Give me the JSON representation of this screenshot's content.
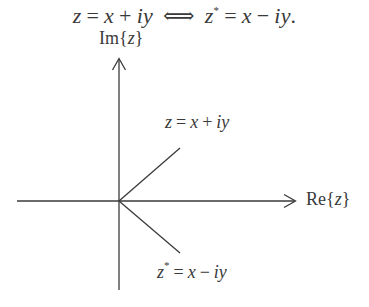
{
  "header": {
    "equation": {
      "lhs_var": "z",
      "eq1": "=",
      "x1": "x",
      "plus": "+",
      "iy1": "iy",
      "iff": "⟺",
      "rhs_var": "z",
      "rhs_star": "*",
      "eq2": "=",
      "x2": "x",
      "minus": "−",
      "iy2": "iy",
      "period": "."
    }
  },
  "axes": {
    "imaginary_label": {
      "prefix": "Im",
      "open": "{",
      "var": "z",
      "close": "}"
    },
    "real_label": {
      "prefix": "Re",
      "open": "{",
      "var": "z",
      "close": "}"
    }
  },
  "vectors": {
    "z": {
      "var": "z",
      "eq": "=",
      "x": "x",
      "op": "+",
      "iy": "iy"
    },
    "z_conjugate": {
      "var": "z",
      "star": "*",
      "eq": "=",
      "x": "x",
      "op": "−",
      "iy": "iy"
    }
  },
  "colors": {
    "ink": "#3a3a3a",
    "background": "#ffffff"
  },
  "geometry": {
    "origin": [
      119,
      201
    ],
    "z_tip": [
      180,
      148
    ],
    "z_conjugate_tip": [
      180,
      253
    ],
    "vertical_axis": {
      "x": 119,
      "top": 58,
      "bottom": 290
    },
    "horizontal_axis": {
      "y": 201,
      "left": 17,
      "right": 296
    }
  }
}
